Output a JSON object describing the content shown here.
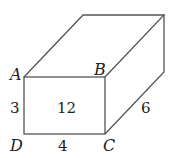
{
  "diagram": {
    "type": "rectangular-prism",
    "vertices": {
      "A": "A",
      "B": "B",
      "C": "C",
      "D": "D"
    },
    "dimensions": {
      "height_AD": "3",
      "width_DC": "4",
      "depth": "6"
    },
    "front_face_area": "12",
    "colors": {
      "stroke": "#555555",
      "text": "#222222",
      "background": "#ffffff"
    }
  }
}
